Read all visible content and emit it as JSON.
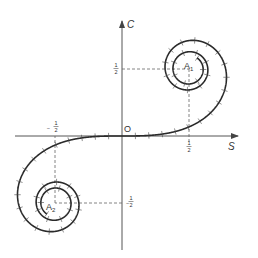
{
  "figure": {
    "origin_label": "O",
    "x_axis_label": "S",
    "y_axis_label": "C",
    "points": [
      {
        "label": "A",
        "subscript": "1",
        "x": 0.5,
        "y": 0.5
      },
      {
        "label": "A",
        "subscript": "2",
        "x": -0.5,
        "y": -0.5
      }
    ],
    "tick_labels": {
      "x_pos": {
        "num": "1",
        "den": "2",
        "sign": ""
      },
      "x_neg": {
        "num": "1",
        "den": "2",
        "sign": "−"
      },
      "y_pos": {
        "num": "1",
        "den": "2",
        "sign": ""
      },
      "y_neg": {
        "num": "1",
        "den": "2",
        "sign": "−"
      }
    },
    "curve": {
      "t_max": 3.1,
      "tick_spacing": 0.1,
      "color": "#2a2a2a"
    },
    "layout": {
      "origin_px": [
        122,
        136
      ],
      "scale_px_per_unit": 134
    }
  }
}
